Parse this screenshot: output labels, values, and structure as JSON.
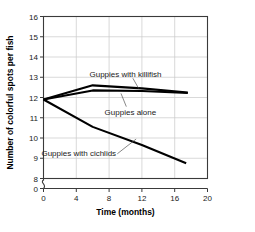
{
  "chart_data": {
    "type": "line",
    "title": "",
    "xlabel": "Time (months)",
    "ylabel": "Number of colorful spots per fish",
    "xlim": [
      0,
      20
    ],
    "ylim": [
      8,
      16
    ],
    "y_axis_break": true,
    "y_zero_tick": "0",
    "grid": true,
    "legend_position": "inline-annotations",
    "xticks": [
      "0",
      "4",
      "8",
      "12",
      "16",
      "20"
    ],
    "xtick_values": [
      0,
      4,
      8,
      12,
      16,
      20
    ],
    "yticks": [
      "8",
      "9",
      "10",
      "11",
      "12",
      "13",
      "14",
      "15",
      "16"
    ],
    "ytick_values": [
      8,
      9,
      10,
      11,
      12,
      13,
      14,
      15,
      16
    ],
    "series": [
      {
        "name": "Guppies with killifish",
        "color": "#000000",
        "x": [
          0,
          6,
          12,
          17.6
        ],
        "values": [
          11.9,
          12.6,
          12.45,
          12.25
        ]
      },
      {
        "name": "Guppies alone",
        "color": "#000000",
        "x": [
          0,
          6,
          12,
          17.6
        ],
        "values": [
          11.9,
          12.35,
          12.32,
          12.22
        ]
      },
      {
        "name": "Guppies with cichlids",
        "color": "#000000",
        "x": [
          0,
          6,
          12,
          17.4
        ],
        "values": [
          11.9,
          10.55,
          9.65,
          8.75
        ]
      }
    ],
    "annotations": [
      {
        "text": "Guppies with killifish",
        "label_x": 10.0,
        "label_y": 13.15
      },
      {
        "text": "Guppies alone",
        "label_x": 10.6,
        "label_y": 11.3
      },
      {
        "text": "Guppies with cichlids",
        "label_x": 4.3,
        "label_y": 9.25
      }
    ]
  }
}
